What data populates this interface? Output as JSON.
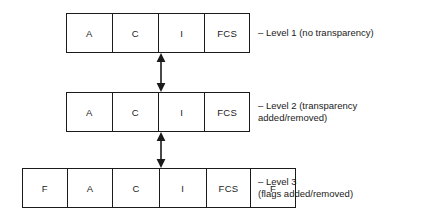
{
  "diagram": {
    "background_color": "#ffffff",
    "line_color": "#1b1b1b",
    "rows": [
      {
        "id": "level-1",
        "cells": [
          {
            "label": "A"
          },
          {
            "label": "C"
          },
          {
            "label": "I"
          },
          {
            "label": "FCS"
          }
        ],
        "annotation": "– Level 1 (no transparency)"
      },
      {
        "id": "level-2",
        "cells": [
          {
            "label": "A"
          },
          {
            "label": "C"
          },
          {
            "label": "I"
          },
          {
            "label": "FCS"
          }
        ],
        "annotation": "– Level 2 (transparency\nadded/removed)"
      },
      {
        "id": "level-3",
        "cells": [
          {
            "label": "F"
          },
          {
            "label": "A"
          },
          {
            "label": "C"
          },
          {
            "label": "I"
          },
          {
            "label": "FCS"
          },
          {
            "label": "F"
          }
        ],
        "annotation": "– Level 3\n(flags added/removed)"
      }
    ],
    "connectors": [
      {
        "id": "connector-1-2",
        "icon": "double-headed-vertical-arrow-icon",
        "from": "level-1",
        "to": "level-2"
      },
      {
        "id": "connector-2-3",
        "icon": "double-headed-vertical-arrow-icon",
        "from": "level-2",
        "to": "level-3"
      }
    ]
  }
}
